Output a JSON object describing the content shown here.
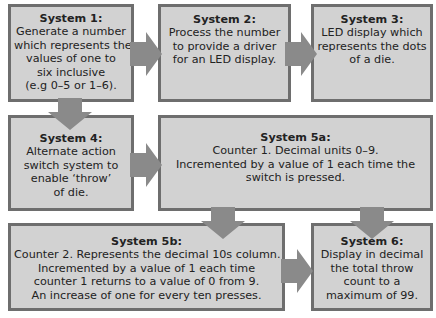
{
  "diagram": {
    "colors": {
      "box_fill": "#d2d2d2",
      "box_border": "#6e6e6e",
      "arrow": "#8a8a8a",
      "text": "#222222"
    },
    "boxes": {
      "s1": {
        "title": "System 1:",
        "lines": [
          "Generate a number",
          "which represents the",
          "values of one to",
          "six inclusive",
          "(e.g 0–5 or 1–6)."
        ]
      },
      "s2": {
        "title": "System 2:",
        "lines": [
          "Process the number",
          "to provide a driver",
          "for an LED display."
        ]
      },
      "s3": {
        "title": "System 3:",
        "lines": [
          "LED display which",
          "represents the dots",
          "of a die."
        ]
      },
      "s4": {
        "title": "System 4:",
        "lines": [
          "Alternate action",
          "switch system to",
          "enable ‘throw’",
          "of die."
        ]
      },
      "s5a": {
        "title": "System 5a:",
        "lines": [
          "Counter 1. Decimal units 0–9.",
          "Incremented by a value of 1 each time the",
          "switch is pressed."
        ]
      },
      "s5b": {
        "title": "System 5b:",
        "lines": [
          "Counter 2. Represents the decimal 10s column.",
          "Incremented by a value of 1 each time",
          "counter 1 returns to a value of 0 from 9.",
          "An increase of one for every ten presses."
        ]
      },
      "s6": {
        "title": "System 6:",
        "lines": [
          "Display in decimal",
          "the total throw",
          "count to a",
          "maximum of 99."
        ]
      }
    },
    "arrows": [
      {
        "from": "s1",
        "to": "s2",
        "direction": "right"
      },
      {
        "from": "s2",
        "to": "s3",
        "direction": "right"
      },
      {
        "from": "s1",
        "to": "s4",
        "direction": "down"
      },
      {
        "from": "s4",
        "to": "s5a",
        "direction": "right"
      },
      {
        "from": "s5a",
        "to": "s5b",
        "direction": "down"
      },
      {
        "from": "s5a",
        "to": "s6",
        "direction": "down"
      },
      {
        "from": "s5b",
        "to": "s6",
        "direction": "right"
      }
    ]
  }
}
